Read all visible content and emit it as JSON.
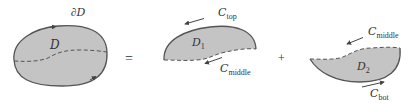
{
  "diagram": {
    "type": "region-decomposition",
    "colors": {
      "fill": "#c4c4c4",
      "stroke": "#555555",
      "text": "#333333",
      "background": "#ffffff"
    },
    "left": {
      "region_label": "D",
      "boundary_label": "∂D",
      "boundary_label_prefix": "∂",
      "boundary_label_main": "D"
    },
    "operators": {
      "equals": "=",
      "plus": "+"
    },
    "region1": {
      "label_main": "D",
      "label_sub": "1",
      "top_curve_main": "C",
      "top_curve_sub": "top",
      "bottom_curve_main": "C",
      "bottom_curve_sub": "middle"
    },
    "region2": {
      "label_main": "D",
      "label_sub": "2",
      "top_curve_main": "C",
      "top_curve_sub": "middle",
      "bottom_curve_main": "C",
      "bottom_curve_sub": "bot"
    }
  }
}
